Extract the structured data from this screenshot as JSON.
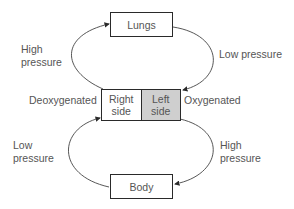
{
  "nodes": {
    "lungs": "Lungs",
    "body": "Body",
    "heart_right": "Right side",
    "heart_left": "Left side"
  },
  "labels": {
    "top_left": "High pressure",
    "top_left_line1": "High",
    "top_left_line2": "pressure",
    "top_right": "Low pressure",
    "bottom_left_line1": "Low",
    "bottom_left_line2": "pressure",
    "bottom_right_line1": "High",
    "bottom_right_line2": "pressure",
    "heart_right_line1": "Right",
    "heart_right_line2": "side",
    "heart_left_line1": "Left",
    "heart_left_line2": "side",
    "deoxygenated": "Deoxygenated",
    "oxygenated": "Oxygenated"
  },
  "colors": {
    "left_side_fill": "#cfcfcf",
    "stroke": "#2a2a2a"
  }
}
